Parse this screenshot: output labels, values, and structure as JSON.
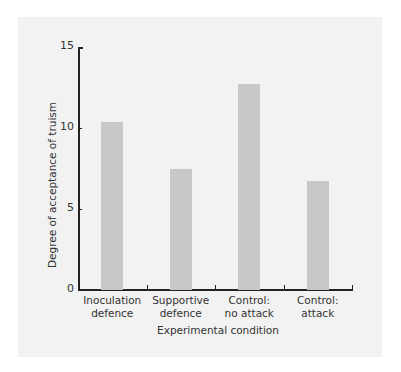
{
  "chart_data": {
    "type": "bar",
    "title": "",
    "xlabel": "Experimental condition",
    "ylabel": "Degree of acceptance of truism",
    "categories": [
      "Inoculation defence",
      "Supportive defence",
      "Control: no attack",
      "Control: attack"
    ],
    "category_lines": [
      [
        "Inoculation",
        "defence"
      ],
      [
        "Supportive",
        "defence"
      ],
      [
        "Control:",
        "no attack"
      ],
      [
        "Control:",
        "attack"
      ]
    ],
    "values": [
      10.4,
      7.5,
      12.7,
      6.7
    ],
    "ylim": [
      0,
      15
    ],
    "yticks": [
      "0",
      "5",
      "10",
      "15"
    ],
    "grid": false,
    "legend": null,
    "bar_color": "#c8c8c8",
    "background": "#f2f2f2"
  }
}
